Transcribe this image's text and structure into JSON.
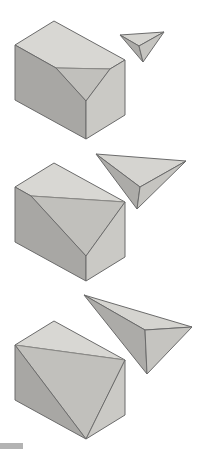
{
  "canvas": {
    "width": 198,
    "height": 449,
    "background": "#ffffff"
  },
  "palette": {
    "box_top": "#d8d7d3",
    "box_front": "#a8a7a4",
    "box_right": "#cac9c5",
    "box_cut": "#c1c0bc",
    "tet_top": "#d5d4d0",
    "tet_left": "#acaba8",
    "tet_right": "#c5c4c0",
    "outline": "#6b6b6b",
    "cut_edge": "#8a8986",
    "artifact_gray": "#b3b3b3"
  },
  "figure": {
    "name": "corner-slice-sequence",
    "rows": [
      {
        "name": "row-small-slice",
        "solids": [
          {
            "name": "box-small-corner-cut",
            "faces": [
              {
                "name": "box-top-face",
                "fill": "box_top",
                "stroke": "outline",
                "points": [
                  [
                    15,
                    45
                  ],
                  [
                    54,
                    21
                  ],
                  [
                    125,
                    60
                  ],
                  [
                    110,
                    69
                  ],
                  [
                    56,
                    68
                  ]
                ]
              },
              {
                "name": "box-cut-face",
                "fill": "box_cut",
                "stroke": "cut_edge",
                "points": [
                  [
                    56,
                    68
                  ],
                  [
                    110,
                    69
                  ],
                  [
                    86,
                    101
                  ]
                ]
              },
              {
                "name": "box-front-face",
                "fill": "box_front",
                "stroke": "outline",
                "points": [
                  [
                    15,
                    45
                  ],
                  [
                    56,
                    68
                  ],
                  [
                    86,
                    101
                  ],
                  [
                    86,
                    139
                  ],
                  [
                    15,
                    100
                  ]
                ]
              },
              {
                "name": "box-right-face",
                "fill": "box_right",
                "stroke": "outline",
                "points": [
                  [
                    110,
                    69
                  ],
                  [
                    125,
                    60
                  ],
                  [
                    125,
                    115
                  ],
                  [
                    86,
                    139
                  ],
                  [
                    86,
                    101
                  ]
                ]
              }
            ]
          },
          {
            "name": "tetrahedron-small",
            "faces": [
              {
                "name": "tet-top-face",
                "fill": "tet_top",
                "stroke": "outline",
                "points": [
                  [
                    120,
                    35
                  ],
                  [
                    164,
                    32
                  ],
                  [
                    139,
                    46
                  ]
                ]
              },
              {
                "name": "tet-left-face",
                "fill": "tet_left",
                "stroke": "outline",
                "points": [
                  [
                    120,
                    35
                  ],
                  [
                    139,
                    46
                  ],
                  [
                    143,
                    62
                  ]
                ]
              },
              {
                "name": "tet-right-face",
                "fill": "tet_right",
                "stroke": "outline",
                "points": [
                  [
                    139,
                    46
                  ],
                  [
                    164,
                    32
                  ],
                  [
                    143,
                    62
                  ]
                ]
              }
            ]
          }
        ]
      },
      {
        "name": "row-medium-slice",
        "solids": [
          {
            "name": "box-medium-corner-cut",
            "faces": [
              {
                "name": "box-top-face",
                "fill": "box_top",
                "stroke": "outline",
                "points": [
                  [
                    15,
                    187
                  ],
                  [
                    54,
                    163
                  ],
                  [
                    125,
                    202
                  ],
                  [
                    31,
                    196
                  ]
                ]
              },
              {
                "name": "box-cut-face",
                "fill": "box_cut",
                "stroke": "cut_edge",
                "points": [
                  [
                    31,
                    196
                  ],
                  [
                    125,
                    202
                  ],
                  [
                    86,
                    256
                  ]
                ]
              },
              {
                "name": "box-front-face",
                "fill": "box_front",
                "stroke": "outline",
                "points": [
                  [
                    15,
                    187
                  ],
                  [
                    31,
                    196
                  ],
                  [
                    86,
                    256
                  ],
                  [
                    86,
                    281
                  ],
                  [
                    15,
                    242
                  ]
                ]
              },
              {
                "name": "box-right-face",
                "fill": "box_right",
                "stroke": "outline",
                "points": [
                  [
                    125,
                    202
                  ],
                  [
                    125,
                    257
                  ],
                  [
                    86,
                    281
                  ],
                  [
                    86,
                    256
                  ]
                ]
              }
            ]
          },
          {
            "name": "tetrahedron-medium",
            "faces": [
              {
                "name": "tet-top-face",
                "fill": "tet_top",
                "stroke": "outline",
                "points": [
                  [
                    96,
                    154
                  ],
                  [
                    186,
                    161
                  ],
                  [
                    140,
                    187
                  ]
                ]
              },
              {
                "name": "tet-left-face",
                "fill": "tet_left",
                "stroke": "outline",
                "points": [
                  [
                    96,
                    154
                  ],
                  [
                    140,
                    187
                  ],
                  [
                    137,
                    209
                  ]
                ]
              },
              {
                "name": "tet-right-face",
                "fill": "tet_right",
                "stroke": "outline",
                "points": [
                  [
                    140,
                    187
                  ],
                  [
                    186,
                    161
                  ],
                  [
                    137,
                    209
                  ]
                ]
              }
            ]
          }
        ]
      },
      {
        "name": "row-large-slice",
        "solids": [
          {
            "name": "box-large-corner-cut",
            "faces": [
              {
                "name": "box-top-face",
                "fill": "box_top",
                "stroke": "outline",
                "points": [
                  [
                    15,
                    345
                  ],
                  [
                    54,
                    321
                  ],
                  [
                    125,
                    360
                  ]
                ]
              },
              {
                "name": "box-cut-face",
                "fill": "box_cut",
                "stroke": "cut_edge",
                "points": [
                  [
                    15,
                    345
                  ],
                  [
                    125,
                    360
                  ],
                  [
                    86,
                    439
                  ]
                ]
              },
              {
                "name": "box-front-face",
                "fill": "box_front",
                "stroke": "outline",
                "points": [
                  [
                    15,
                    345
                  ],
                  [
                    86,
                    439
                  ],
                  [
                    15,
                    400
                  ]
                ]
              },
              {
                "name": "box-right-face",
                "fill": "box_right",
                "stroke": "outline",
                "points": [
                  [
                    125,
                    360
                  ],
                  [
                    125,
                    415
                  ],
                  [
                    86,
                    439
                  ]
                ]
              }
            ]
          },
          {
            "name": "tetrahedron-large",
            "faces": [
              {
                "name": "tet-top-face",
                "fill": "tet_top",
                "stroke": "outline",
                "points": [
                  [
                    84,
                    295
                  ],
                  [
                    192,
                    327
                  ],
                  [
                    145,
                    330
                  ]
                ]
              },
              {
                "name": "tet-left-face",
                "fill": "tet_left",
                "stroke": "outline",
                "points": [
                  [
                    84,
                    295
                  ],
                  [
                    145,
                    330
                  ],
                  [
                    147,
                    374
                  ]
                ]
              },
              {
                "name": "tet-right-face",
                "fill": "tet_right",
                "stroke": "outline",
                "points": [
                  [
                    145,
                    330
                  ],
                  [
                    192,
                    327
                  ],
                  [
                    147,
                    374
                  ]
                ]
              }
            ]
          }
        ]
      }
    ],
    "artifacts": [
      {
        "name": "partial-gray-bar",
        "x": 0,
        "y": 443,
        "width": 23,
        "height": 6,
        "fill": "artifact_gray"
      }
    ]
  }
}
